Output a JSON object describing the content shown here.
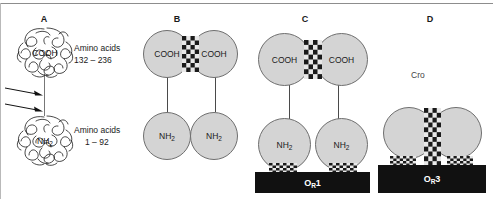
{
  "figure": {
    "colors": {
      "circle_fill": "#d4d4d4",
      "circle_stroke": "#6f6f6f",
      "operator_box": "#111111",
      "checker_dark": "#1a1a1a",
      "checker_light": "#e8e8e8",
      "rule": "#8d8d8d"
    }
  },
  "panels": [
    {
      "letter": "A",
      "name": "repressor-monomer",
      "labels": {
        "cooh_domain": "COOH",
        "nh2_domain": "NH",
        "nh2_sub": "2",
        "cooh_caption_line1": "Amino acids",
        "cooh_caption_line2": "132 – 236",
        "nh2_caption_line1": "Amino acids",
        "nh2_caption_line2": "1 – 92"
      },
      "arrows": [
        {
          "name": "protease-cleavage-arrow-upper"
        },
        {
          "name": "protease-cleavage-arrow-lower"
        }
      ]
    },
    {
      "letter": "B",
      "name": "repressor-dimer-free",
      "subunits": [
        {
          "label": "COOH",
          "sub": ""
        },
        {
          "label": "COOH",
          "sub": ""
        },
        {
          "label": "NH",
          "sub": "2"
        },
        {
          "label": "NH",
          "sub": "2"
        }
      ]
    },
    {
      "letter": "C",
      "name": "repressor-dimer-bound-or1",
      "subunits": [
        {
          "label": "COOH",
          "sub": ""
        },
        {
          "label": "COOH",
          "sub": ""
        },
        {
          "label": "NH",
          "sub": "2"
        },
        {
          "label": "NH",
          "sub": "2"
        }
      ],
      "operator": {
        "label": "O",
        "sub": "R",
        "suffix": "1"
      }
    },
    {
      "letter": "D",
      "name": "cro-dimer-bound-or3",
      "protein_label": "Cro",
      "operator": {
        "label": "O",
        "sub": "R",
        "suffix": "3"
      }
    }
  ]
}
